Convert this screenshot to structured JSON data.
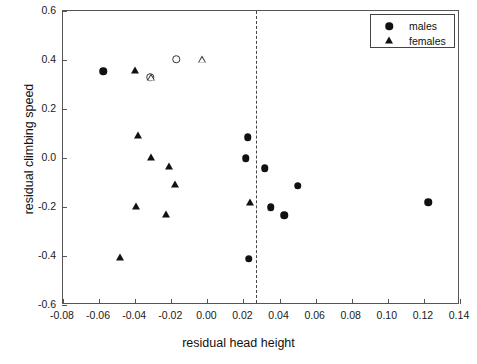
{
  "chart_data": {
    "type": "scatter",
    "title": "",
    "xlabel": "residual head height",
    "ylabel": "residual climbing speed",
    "xlim": [
      -0.08,
      0.14
    ],
    "ylim": [
      -0.6,
      0.6
    ],
    "xticks": [
      "-0.08",
      "-0.06",
      "-0.04",
      "-0.02",
      "0.00",
      "0.02",
      "0.04",
      "0.06",
      "0.08",
      "0.10",
      "0.12",
      "0.14"
    ],
    "xtick_values": [
      -0.08,
      -0.06,
      -0.04,
      -0.02,
      0.0,
      0.02,
      0.04,
      0.06,
      0.08,
      0.1,
      0.12,
      0.14
    ],
    "yticks": [
      "0.6",
      "0.4",
      "0.2",
      "0.0",
      "-0.2",
      "-0.4",
      "-0.6"
    ],
    "ytick_values": [
      0.6,
      0.4,
      0.2,
      0.0,
      -0.2,
      -0.4,
      -0.6
    ],
    "grid": false,
    "legend_position": "top-right",
    "annotations": [
      {
        "type": "vline",
        "x": 0.0268,
        "style": "dashed",
        "color": "#444444"
      }
    ],
    "series": [
      {
        "name": "males",
        "marker": "circle",
        "fill": "filled",
        "color": "#111111",
        "points": [
          {
            "x": -0.0577,
            "y": 0.355
          },
          {
            "x": 0.0223,
            "y": 0.085
          },
          {
            "x": 0.0212,
            "y": 0.0
          },
          {
            "x": 0.0317,
            "y": -0.041
          },
          {
            "x": 0.0501,
            "y": -0.114
          },
          {
            "x": 0.035,
            "y": -0.2
          },
          {
            "x": 0.0427,
            "y": -0.233
          },
          {
            "x": 0.1224,
            "y": -0.18
          },
          {
            "x": 0.0228,
            "y": -0.412
          }
        ]
      },
      {
        "name": "females",
        "marker": "triangle",
        "fill": "filled",
        "color": "#111111",
        "points": [
          {
            "x": -0.0401,
            "y": 0.355
          },
          {
            "x": -0.0384,
            "y": 0.09
          },
          {
            "x": -0.0312,
            "y": 0.0
          },
          {
            "x": -0.0212,
            "y": -0.037
          },
          {
            "x": -0.0178,
            "y": -0.11
          },
          {
            "x": -0.0394,
            "y": -0.2
          },
          {
            "x": -0.0227,
            "y": -0.233
          },
          {
            "x": -0.0484,
            "y": -0.408
          },
          {
            "x": 0.0239,
            "y": -0.18
          }
        ]
      },
      {
        "name": "open-circles",
        "marker": "circle",
        "fill": "open",
        "color": "#333333",
        "points": [
          {
            "x": -0.0173,
            "y": 0.404
          },
          {
            "x": -0.0317,
            "y": 0.33
          }
        ]
      },
      {
        "name": "open-triangles",
        "marker": "triangle",
        "fill": "open",
        "color": "#333333",
        "points": [
          {
            "x": -0.0028,
            "y": 0.404
          },
          {
            "x": -0.0312,
            "y": 0.33
          }
        ]
      }
    ]
  },
  "legend": {
    "entries": [
      {
        "label": "males",
        "marker": "circle"
      },
      {
        "label": "females",
        "marker": "triangle"
      }
    ]
  }
}
